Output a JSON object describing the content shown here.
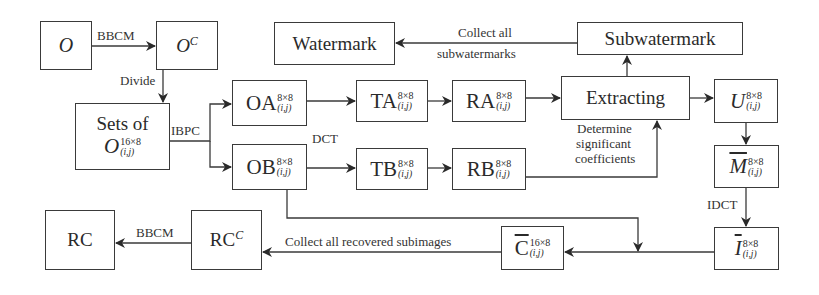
{
  "diagram": {
    "nodes": {
      "o": {
        "base": "O"
      },
      "oc": {
        "base": "O",
        "sup": "C"
      },
      "sets": {
        "line1": "Sets of",
        "base": "O",
        "sup": "16×8",
        "sub": "(i,j)"
      },
      "oa": {
        "base": "OA",
        "sup": "8×8",
        "sub": "(i,j)"
      },
      "ob": {
        "base": "OB",
        "sup": "8×8",
        "sub": "(i,j)"
      },
      "ta": {
        "base": "TA",
        "sup": "8×8",
        "sub": "(i,j)"
      },
      "tb": {
        "base": "TB",
        "sup": "8×8",
        "sub": "(i,j)"
      },
      "ra": {
        "base": "RA",
        "sup": "8×8",
        "sub": "(i,j)"
      },
      "rb": {
        "base": "RB",
        "sup": "8×8",
        "sub": "(i,j)"
      },
      "extracting": {
        "label": "Extracting"
      },
      "subwatermark": {
        "label": "Subwatermark"
      },
      "watermark": {
        "label": "Watermark"
      },
      "u": {
        "base": "U",
        "sup": "8×8",
        "sub": "(i,j)"
      },
      "m": {
        "base": "M",
        "sup": "8×8",
        "sub": "(i,j)",
        "overline": true
      },
      "i": {
        "base": "I",
        "sup": "8×8",
        "sub": "(i,j)",
        "overline": true
      },
      "c": {
        "base": "C",
        "sup": "16×8",
        "sub": "(i,j)",
        "overline": true
      },
      "rcc": {
        "base": "RC",
        "sup": "C"
      },
      "rc": {
        "label": "RC"
      }
    },
    "edge_labels": {
      "bbcm_top": "BBCM",
      "divide": "Divide",
      "ibpc": "IBPC",
      "dct": "DCT",
      "collect_sub_1": "Collect all",
      "collect_sub_2": "subwatermarks",
      "determine_1": "Determine",
      "determine_2": "significant",
      "determine_3": "coefficients",
      "idct": "IDCT",
      "collect_recovered": "Collect all recovered subimages",
      "bbcm_bottom": "BBCM"
    },
    "colors": {
      "line": "#3a3a3a",
      "background": "#ffffff"
    }
  }
}
